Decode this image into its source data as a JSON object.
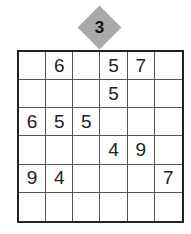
{
  "puzzle": {
    "level": "3",
    "grid": [
      [
        "",
        "6",
        "",
        "5",
        "7",
        ""
      ],
      [
        "",
        "",
        "",
        "5",
        "",
        ""
      ],
      [
        "6",
        "5",
        "5",
        "",
        "",
        ""
      ],
      [
        "",
        "",
        "",
        "4",
        "9",
        ""
      ],
      [
        "9",
        "4",
        "",
        "",
        "",
        "7"
      ],
      [
        "",
        "",
        "",
        "",
        "",
        ""
      ]
    ]
  }
}
